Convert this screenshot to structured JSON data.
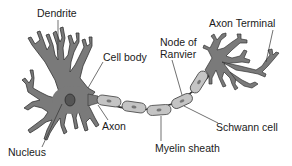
{
  "diagram": {
    "colors": {
      "neuron_fill": "#7a7a7a",
      "neuron_stroke": "#333333",
      "myelin_fill": "#c4c4c4",
      "myelin_stroke": "#444444",
      "nucleus_fill": "#555555",
      "leader_line": "#333333",
      "text": "#1a1a1a"
    },
    "labels": {
      "dendrite": "Dendrite",
      "cell_body": "Cell body",
      "node_of_ranvier_line1": "Node of",
      "node_of_ranvier_line2": "Ranvier",
      "axon_terminal": "Axon Terminal",
      "axon": "Axon",
      "nucleus": "Nucleus",
      "myelin_sheath": "Myelin sheath",
      "schwann_cell": "Schwann cell"
    }
  }
}
